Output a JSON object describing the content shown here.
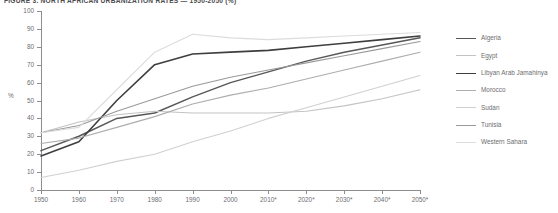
{
  "chart_data": {
    "type": "line",
    "title": "FIGURE 3. NORTH AFRICAN URBANIZATION RATES — 1950-2050 (%)",
    "xlabel": "",
    "ylabel": "%",
    "ylim": [
      0,
      100
    ],
    "ytick_step": 10,
    "yticks": [
      0,
      10,
      20,
      30,
      40,
      50,
      60,
      70,
      80,
      90,
      100
    ],
    "x": [
      "1950",
      "1960",
      "1970",
      "1980",
      "1990",
      "2000",
      "2010*",
      "2020*",
      "2030*",
      "2040*",
      "2050*"
    ],
    "xlim": [
      1950,
      2050
    ],
    "grid": false,
    "legend_position": "right",
    "note": "Years marked with an asterisk are projections.",
    "series": [
      {
        "name": "Algeria",
        "color": "#58585a",
        "width": 1.5,
        "values": [
          22,
          30,
          40,
          43,
          52,
          60,
          66,
          72,
          77,
          81,
          85
        ]
      },
      {
        "name": "Egypt",
        "color": "#c3c3c5",
        "width": 1.1,
        "values": [
          32,
          38,
          42,
          44,
          43,
          43,
          43,
          44,
          47,
          51,
          56
        ]
      },
      {
        "name": "Libyan Arab Jamahinya",
        "color": "#3e3e40",
        "width": 1.6,
        "values": [
          19,
          27,
          50,
          70,
          76,
          77,
          78,
          80,
          82,
          84,
          86
        ]
      },
      {
        "name": "Morocco",
        "color": "#adadaf",
        "width": 1.1,
        "values": [
          26,
          29,
          35,
          41,
          48,
          53,
          57,
          62,
          67,
          72,
          77
        ]
      },
      {
        "name": "Sudan",
        "color": "#d0d0d2",
        "width": 1.1,
        "values": [
          7,
          11,
          16,
          20,
          27,
          33,
          40,
          46,
          52,
          58,
          64
        ]
      },
      {
        "name": "Tunisia",
        "color": "#9a9a9c",
        "width": 1.1,
        "values": [
          32,
          36,
          44,
          51,
          58,
          63,
          67,
          71,
          75,
          79,
          83
        ]
      },
      {
        "name": "Western Sahara",
        "color": "#dcdcde",
        "width": 1.1,
        "values": [
          32,
          35,
          56,
          77,
          87,
          85,
          84,
          85,
          86,
          87,
          88
        ]
      }
    ]
  },
  "legend": {
    "items": [
      {
        "label": "Algeria",
        "color": "#58585a",
        "width": "1.5px"
      },
      {
        "label": "Egypt",
        "color": "#c3c3c5",
        "width": "1.1px"
      },
      {
        "label": "Libyan Arab Jamahinya",
        "color": "#3e3e40",
        "width": "1.6px"
      },
      {
        "label": "Morocco",
        "color": "#adadaf",
        "width": "1.1px"
      },
      {
        "label": "Sudan",
        "color": "#d0d0d2",
        "width": "1.1px"
      },
      {
        "label": "Tunisia",
        "color": "#9a9a9c",
        "width": "1.1px"
      },
      {
        "label": "Western Sahara",
        "color": "#dcdcde",
        "width": "1.1px"
      }
    ]
  }
}
